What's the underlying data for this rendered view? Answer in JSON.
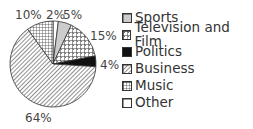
{
  "chart_data": {
    "type": "pie",
    "title": "",
    "start_angle_deg": 0,
    "direction": "clockwise",
    "slices": [
      {
        "name": "Other",
        "value": 2,
        "label": "2%",
        "pattern": "white"
      },
      {
        "name": "Sports",
        "value": 5,
        "label": "5%",
        "pattern": "gray"
      },
      {
        "name": "Television and Film",
        "value": 15,
        "label": "15%",
        "pattern": "checker"
      },
      {
        "name": "Politics",
        "value": 4,
        "label": "4%",
        "pattern": "black"
      },
      {
        "name": "Business",
        "value": 64,
        "label": "64%",
        "pattern": "diagonal"
      },
      {
        "name": "Music",
        "value": 10,
        "label": "10%",
        "pattern": "grid"
      }
    ],
    "legend": [
      "Sports",
      "Television and Film",
      "Politics",
      "Business",
      "Music",
      "Other"
    ],
    "legend_position": "right"
  },
  "labels": {
    "other": "2%",
    "sports": "5%",
    "tv": "15%",
    "politics": "4%",
    "business": "64%",
    "music": "10%"
  },
  "legend": {
    "items": [
      {
        "label": "Sports"
      },
      {
        "label": "Television and Film"
      },
      {
        "label": "Politics"
      },
      {
        "label": "Business"
      },
      {
        "label": "Music"
      },
      {
        "label": "Other"
      }
    ]
  }
}
